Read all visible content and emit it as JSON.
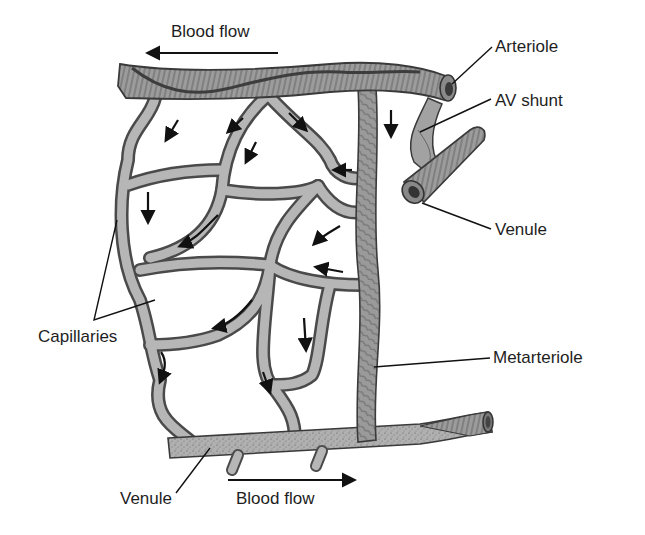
{
  "diagram": {
    "labels": {
      "blood_flow_top": "Blood flow",
      "arteriole": "Arteriole",
      "av_shunt": "AV shunt",
      "venule_right": "Venule",
      "capillaries": "Capillaries",
      "metarteriole": "Metarteriole",
      "venule_bottom": "Venule",
      "blood_flow_bottom": "Blood flow"
    },
    "flow_directions": {
      "top": "left",
      "bottom": "right"
    },
    "colors": {
      "vessel_fill": "#a9a9a9",
      "vessel_dark": "#6b6b6b",
      "vessel_outline": "#3a3a3a",
      "capillary_fill": "#b4b4b4",
      "background": "#ffffff",
      "text": "#1e1e1e"
    }
  }
}
